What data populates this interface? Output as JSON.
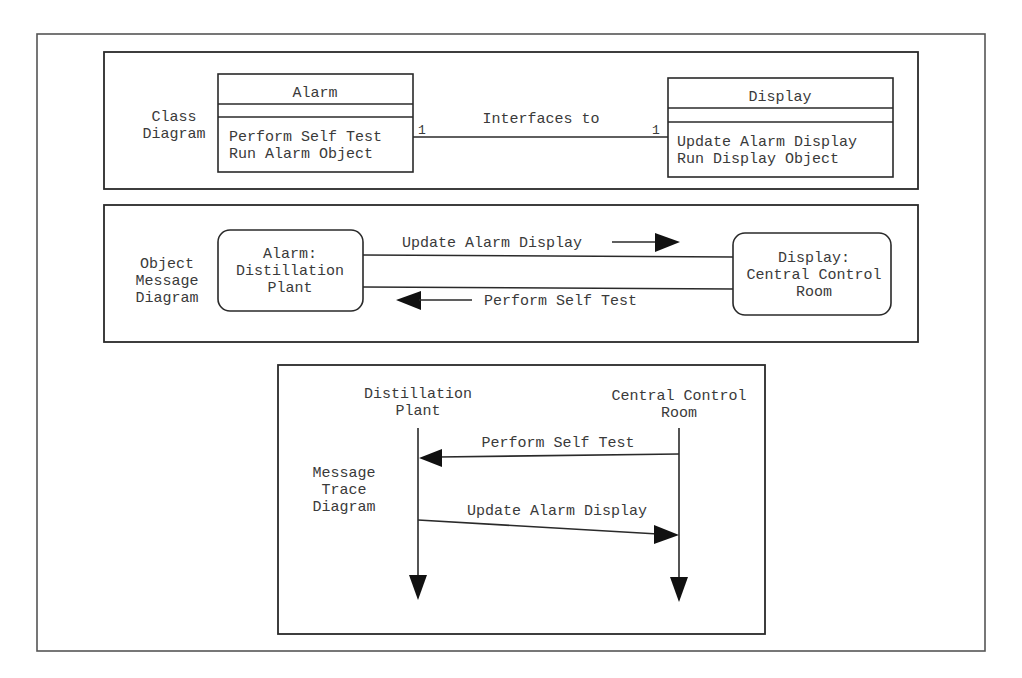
{
  "figure": {
    "panels": {
      "class_diagram": {
        "label_lines": [
          "Class",
          "Diagram"
        ],
        "classes": [
          {
            "name": "Alarm",
            "attributes": [],
            "operations": [
              "Perform Self Test",
              "Run Alarm Object"
            ]
          },
          {
            "name": "Display",
            "attributes": [],
            "operations": [
              "Update Alarm Display",
              "Run Display Object"
            ]
          }
        ],
        "association": {
          "label": "Interfaces to",
          "multiplicity_left": "1",
          "multiplicity_right": "1"
        }
      },
      "object_message_diagram": {
        "label_lines": [
          "Object",
          "Message",
          "Diagram"
        ],
        "objects": [
          {
            "lines": [
              "Alarm:",
              "Distillation",
              "Plant"
            ]
          },
          {
            "lines": [
              "Display:",
              "Central Control",
              "Room"
            ]
          }
        ],
        "messages": [
          {
            "label": "Update Alarm Display",
            "direction": "right"
          },
          {
            "label": "Perform Self Test",
            "direction": "left"
          }
        ]
      },
      "message_trace_diagram": {
        "label_lines": [
          "Message",
          "Trace",
          "Diagram"
        ],
        "lifelines": [
          {
            "lines": [
              "Distillation",
              "Plant"
            ]
          },
          {
            "lines": [
              "Central Control",
              "Room"
            ]
          }
        ],
        "messages": [
          {
            "label": "Perform Self Test",
            "from": "Central Control Room",
            "to": "Distillation Plant"
          },
          {
            "label": "Update Alarm Display",
            "from": "Distillation Plant",
            "to": "Central Control Room"
          }
        ]
      }
    },
    "colors": {
      "ink": "#2a2a2a",
      "text": "#3a3a3a",
      "background": "#ffffff"
    }
  }
}
